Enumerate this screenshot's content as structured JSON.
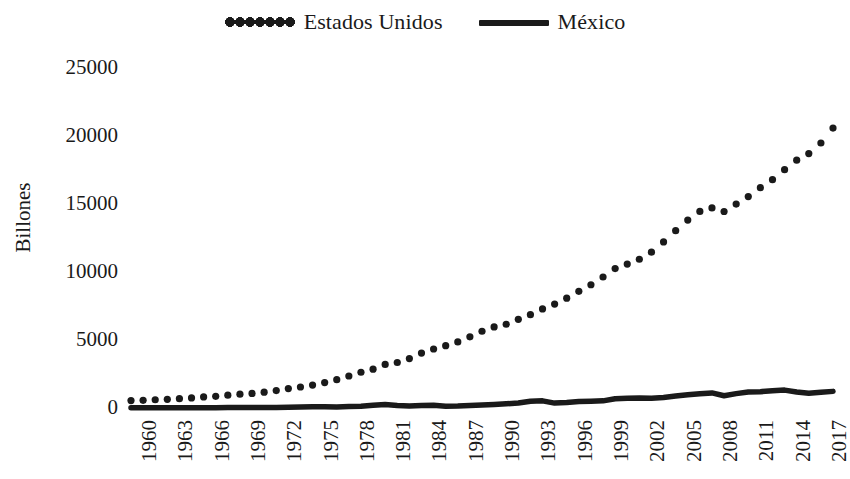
{
  "chart_data": {
    "type": "line",
    "title": "",
    "subtitle": "",
    "xlabel": "",
    "ylabel": "Billones",
    "xlim": [
      1960,
      2018
    ],
    "ylim": [
      0,
      25000
    ],
    "ytick_labels": [
      "0",
      "5000",
      "10000",
      "15000",
      "20000",
      "25000"
    ],
    "ytick_values": [
      0,
      5000,
      10000,
      15000,
      20000,
      25000
    ],
    "xtick_labels": [
      "1960",
      "1963",
      "1966",
      "1969",
      "1972",
      "1975",
      "1978",
      "1981",
      "1984",
      "1987",
      "1990",
      "1993",
      "1996",
      "1999",
      "2002",
      "2005",
      "2008",
      "2011",
      "2014",
      "2017"
    ],
    "xtick_values": [
      1960,
      1963,
      1966,
      1969,
      1972,
      1975,
      1978,
      1981,
      1984,
      1987,
      1990,
      1993,
      1996,
      1999,
      2002,
      2005,
      2008,
      2011,
      2014,
      2017
    ],
    "grid": false,
    "legend_position": "top-center",
    "x": [
      1960,
      1961,
      1962,
      1963,
      1964,
      1965,
      1966,
      1967,
      1968,
      1969,
      1970,
      1971,
      1972,
      1973,
      1974,
      1975,
      1976,
      1977,
      1978,
      1979,
      1980,
      1981,
      1982,
      1983,
      1984,
      1985,
      1986,
      1987,
      1988,
      1989,
      1990,
      1991,
      1992,
      1993,
      1994,
      1995,
      1996,
      1997,
      1998,
      1999,
      2000,
      2001,
      2002,
      2003,
      2004,
      2005,
      2006,
      2007,
      2008,
      2009,
      2010,
      2011,
      2012,
      2013,
      2014,
      2015,
      2016,
      2017,
      2018
    ],
    "series": [
      {
        "name": "Estados Unidos",
        "style": "dotted",
        "color": "#1a1a1a",
        "values": [
          543,
          563,
          605,
          638,
          685,
          743,
          815,
          861,
          943,
          1020,
          1073,
          1165,
          1279,
          1425,
          1545,
          1685,
          1873,
          2082,
          2352,
          2627,
          2857,
          3207,
          3344,
          3634,
          4038,
          4339,
          4580,
          4855,
          5236,
          5642,
          5963,
          6158,
          6520,
          6859,
          7287,
          7640,
          8073,
          8578,
          9063,
          9631,
          10251,
          10582,
          10936,
          11458,
          12214,
          13037,
          13815,
          14452,
          14713,
          14449,
          14992,
          15543,
          16197,
          16785,
          17522,
          18219,
          18707,
          19485,
          20580
        ]
      },
      {
        "name": "México",
        "style": "solid",
        "color": "#1a1a1a",
        "values": [
          13,
          14,
          15,
          17,
          20,
          22,
          24,
          26,
          29,
          32,
          36,
          39,
          45,
          55,
          73,
          89,
          89,
          82,
          103,
          136,
          195,
          250,
          188,
          149,
          185,
          196,
          130,
          142,
          183,
          223,
          263,
          314,
          363,
          500,
          527,
          360,
          401,
          480,
          502,
          526,
          684,
          725,
          742,
          713,
          771,
          877,
          975,
          1053,
          1110,
          900,
          1058,
          1180,
          1201,
          1274,
          1315,
          1172,
          1078,
          1159,
          1222
        ]
      }
    ]
  },
  "legend": {
    "entries": [
      {
        "label": "Estados Unidos",
        "style": "dotted"
      },
      {
        "label": "México",
        "style": "solid"
      }
    ]
  },
  "axes": {
    "y_title": "Billones"
  }
}
